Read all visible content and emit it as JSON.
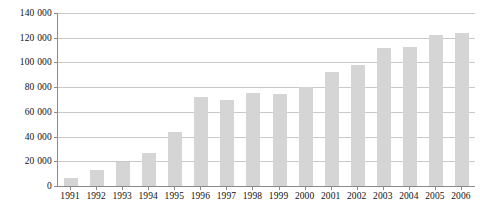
{
  "chart_data": {
    "type": "bar",
    "title": "",
    "subtitle": "",
    "xlabel": "",
    "ylabel": "",
    "categories": [
      "1991",
      "1992",
      "1993",
      "1994",
      "1995",
      "1996",
      "1997",
      "1998",
      "1999",
      "2000",
      "2001",
      "2002",
      "2003",
      "2004",
      "2005",
      "2006"
    ],
    "values": [
      6500,
      13000,
      19500,
      27000,
      43500,
      72000,
      69500,
      75500,
      74500,
      80500,
      92500,
      98000,
      112000,
      112500,
      122500,
      123500
    ],
    "ylim": [
      0,
      140000
    ],
    "ytick_values": [
      0,
      20000,
      40000,
      60000,
      80000,
      100000,
      120000,
      140000
    ],
    "ytick_labels": [
      "0",
      "20 000",
      "40 000",
      "60 000",
      "80 000",
      "100 000",
      "120 000",
      "140 000"
    ],
    "grid": true,
    "grid_axis": "y",
    "legend": false,
    "legend_position": "none",
    "bar_color": "#d5d5d5",
    "gridline_color": "#c9c9c9",
    "axis_color": "#8a8a8a",
    "text_color": "#111111"
  }
}
